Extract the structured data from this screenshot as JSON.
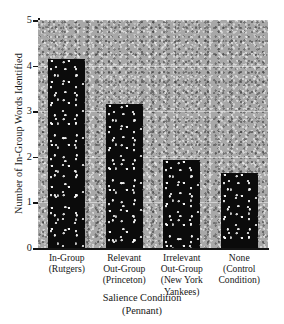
{
  "chart_data": {
    "type": "bar",
    "title": "",
    "xlabel": "Salience Condition",
    "xlabel_sub": "(Pennant)",
    "ylabel": "Number of In-Group Words Identified",
    "ylim": [
      0,
      5
    ],
    "yticks": [
      "0",
      "1",
      "2",
      "3",
      "4",
      "5"
    ],
    "grid": true,
    "legend": "none",
    "categories": [
      "In-Group\n(Rutgers)",
      "Relevant\nOut-Group\n(Princeton)",
      "Irrelevant\nOut-Group\n(New York\nYankees)",
      "None\n(Control\nCondition)"
    ],
    "category_lines": [
      [
        "In-Group",
        "(Rutgers)"
      ],
      [
        "Relevant",
        "Out-Group",
        "(Princeton)"
      ],
      [
        "Irrelevant",
        "Out-Group",
        "(New York",
        "Yankees)"
      ],
      [
        "None",
        "(Control",
        "Condition)"
      ]
    ],
    "values": [
      4.15,
      3.15,
      1.93,
      1.65
    ],
    "bar_color": "#0b0b0b",
    "plot_background_color": "#a8a8a8",
    "axis_color": "#141414"
  }
}
